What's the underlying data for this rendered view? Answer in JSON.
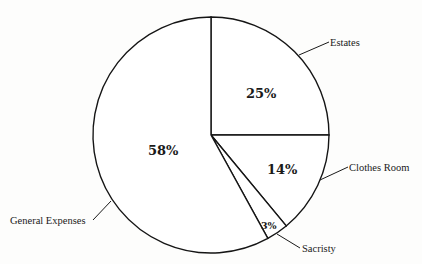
{
  "chart_data": {
    "type": "pie",
    "title": "",
    "start_angle": "12 o'clock, clockwise",
    "slices": [
      {
        "label": "Estates",
        "value": 25,
        "display": "25%"
      },
      {
        "label": "Clothes Room",
        "value": 14,
        "display": "14%"
      },
      {
        "label": "Sacristy",
        "value": 3,
        "display": "3%"
      },
      {
        "label": "General Expenses",
        "value": 58,
        "display": "58%"
      }
    ],
    "categories": [
      "Estates",
      "Clothes Room",
      "Sacristy",
      "General Expenses"
    ],
    "values": [
      25,
      14,
      3,
      58
    ],
    "legend": "none (external callout labels with leader lines)",
    "colors": {
      "fill": "#ffffff",
      "stroke": "#151515",
      "background": "#fdfdfc"
    }
  }
}
